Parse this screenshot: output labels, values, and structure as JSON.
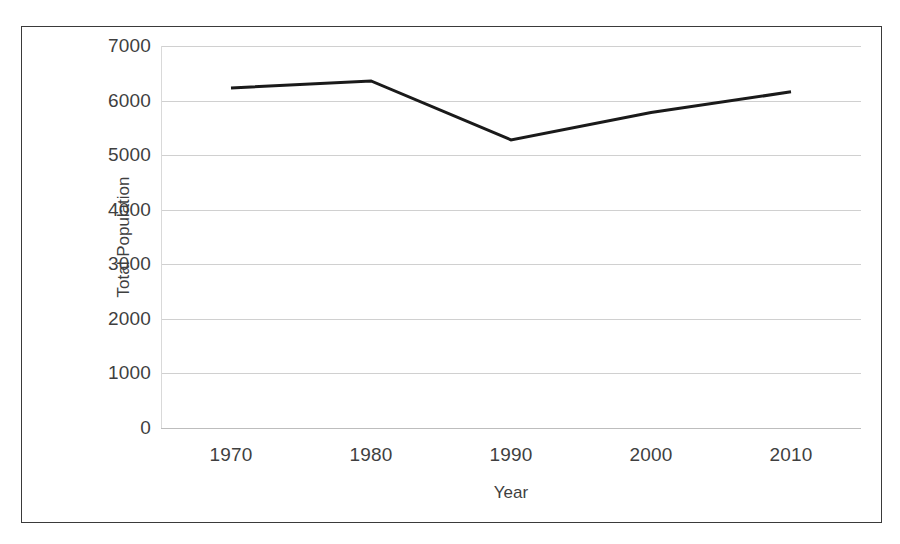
{
  "chart_data": {
    "type": "line",
    "title": "",
    "xlabel": "Year",
    "ylabel": "Total Population",
    "categories": [
      "1970",
      "1980",
      "1990",
      "2000",
      "2010"
    ],
    "x": [
      1970,
      1980,
      1990,
      2000,
      2010
    ],
    "values": [
      6230,
      6360,
      5280,
      5780,
      6160
    ],
    "series": [
      {
        "name": "Total Population",
        "values": [
          6230,
          6360,
          5280,
          5780,
          6160
        ],
        "color": "#1a1a1a",
        "line_width": 3
      }
    ],
    "ylim": [
      0,
      7000
    ],
    "y_ticks": [
      0,
      1000,
      2000,
      3000,
      4000,
      5000,
      6000,
      7000
    ],
    "y_tick_labels": [
      "0",
      "1000",
      "2000",
      "3000",
      "4000",
      "5000",
      "6000",
      "7000"
    ],
    "x_tick_labels": [
      "1970",
      "1980",
      "1990",
      "2000",
      "2010"
    ],
    "grid": "horizontal",
    "gridline_color": "#d0d0d0",
    "legend": "none",
    "legend_position": "none",
    "background": "#ffffff",
    "border_color": "#3a3a3a",
    "markers": "none",
    "annotations": []
  },
  "axes": {
    "y_title": "Total Population",
    "x_title": "Year"
  }
}
